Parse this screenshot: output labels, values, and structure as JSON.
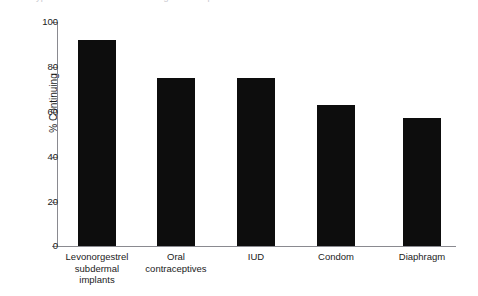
{
  "figure": {
    "title_remnant": "ypical continuation rates among contraceptive users",
    "background_color": "#ffffff",
    "bar_color": "#0d0d0d",
    "axis_color": "#8a8a90",
    "text_color": "#1b1b1b"
  },
  "chart_data": {
    "type": "bar",
    "title": "",
    "xlabel": "",
    "ylabel": "% Continuing",
    "categories": [
      "Levonorgestrel\nsubdermal\nimplants",
      "Oral\ncontraceptives",
      "IUD",
      "Condom",
      "Diaphragm"
    ],
    "values": [
      92,
      75,
      75,
      63,
      57
    ],
    "ylim": [
      0,
      100
    ],
    "yticks": [
      0,
      20,
      40,
      60,
      80,
      100
    ],
    "ytick_labels": [
      "0",
      "20",
      "40",
      "60",
      "80",
      "100"
    ],
    "grid": false,
    "legend": null
  }
}
